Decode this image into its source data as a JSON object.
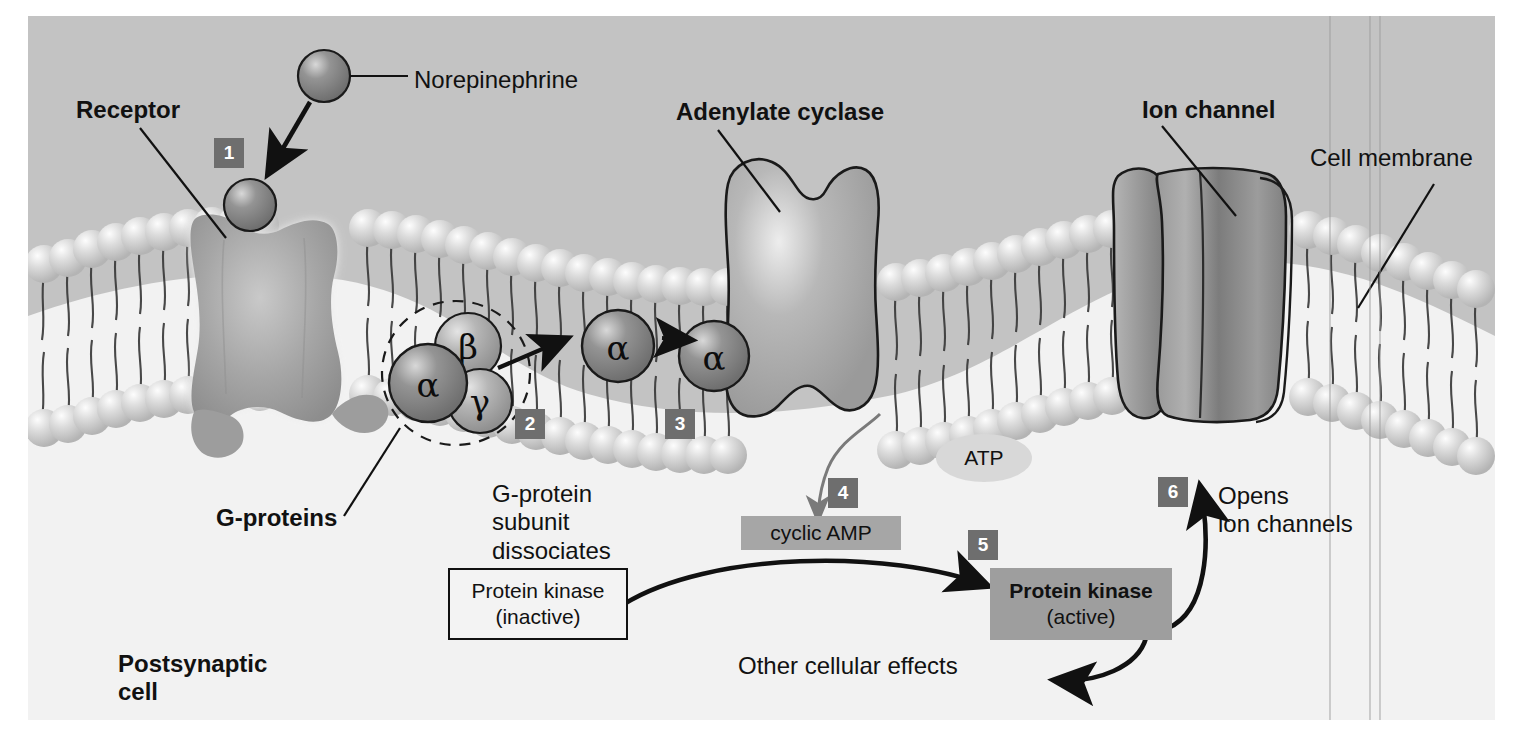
{
  "figure": {
    "colors": {
      "extracellular_bg": "#c3c3c3",
      "intracellular_bg": "#f2f2f2",
      "badge_bg": "#6e6e6e",
      "badge_text": "#ffffff",
      "ligand_sphere": "#8a8a8a",
      "alpha_subunit": "#7d7d7d",
      "beta_gamma_subunit": "#a9a9a9",
      "phospholipid_head": "#d2d2d2",
      "protein_body": "#a8a8a8",
      "ion_channel": "#8f8f8f",
      "highlight_chip": "#a6a6a6",
      "outline": "#1a1a1a"
    }
  },
  "labels": {
    "receptor": "Receptor",
    "norepinephrine": "Norepinephrine",
    "adenylate_cyclase": "Adenylate cyclase",
    "ion_channel": "Ion channel",
    "cell_membrane": "Cell membrane",
    "g_proteins": "G-proteins",
    "postsynaptic_cell": "Postsynaptic\ncell",
    "g_protein_dissociates": "G-protein\nsubunit\ndissociates",
    "opens_ion_channels": "Opens\nion channels",
    "other_cellular_effects": "Other cellular effects"
  },
  "subunits": {
    "alpha": "α",
    "beta": "β",
    "gamma": "γ"
  },
  "molecules": {
    "atp": "ATP",
    "cyclic_amp": "cyclic AMP"
  },
  "kinase": {
    "inactive_line1": "Protein kinase",
    "inactive_line2": "(inactive)",
    "active_line1": "Protein kinase",
    "active_line2": "(active)"
  },
  "steps": [
    {
      "number": "1",
      "caption": "Norepinephrine binds receptor"
    },
    {
      "number": "2",
      "caption": "G-protein subunit dissociates"
    },
    {
      "number": "3",
      "caption": "Alpha subunit activates adenylate cyclase"
    },
    {
      "number": "4",
      "caption": "ATP converted to cyclic AMP"
    },
    {
      "number": "5",
      "caption": "Protein kinase activated"
    },
    {
      "number": "6",
      "caption": "Opens ion channels"
    }
  ]
}
